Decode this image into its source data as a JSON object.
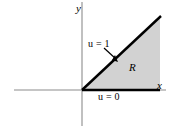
{
  "figure": {
    "kind": "math-diagram",
    "background_color": "#ffffff"
  },
  "axes": {
    "y_axis": {
      "label": "y",
      "color": "#8c8c8c",
      "orientation": "vertical"
    },
    "x_axis": {
      "label": "x",
      "color": "#8c8c8c",
      "orientation": "horizontal"
    },
    "origin": {
      "x": 82,
      "y": 90
    }
  },
  "region": {
    "label": "R",
    "fill_color": "#d2d2d2",
    "edge_color": "#000000",
    "vertices": [
      {
        "x": 82,
        "y": 90
      },
      {
        "x": 160,
        "y": 90
      },
      {
        "x": 160,
        "y": 17
      }
    ]
  },
  "annotations": [
    {
      "name": "upper-boundary-condition",
      "text": "u = 1",
      "variable": "u",
      "relation": "=",
      "value": "1",
      "has_leader_arrow": true,
      "arrow_from": {
        "x": 105,
        "y": 49
      },
      "arrow_to": {
        "x": 117,
        "y": 61
      }
    },
    {
      "name": "lower-boundary-condition",
      "text": "u = 0",
      "variable": "u",
      "relation": "=",
      "value": "0",
      "has_leader_arrow": false
    }
  ]
}
